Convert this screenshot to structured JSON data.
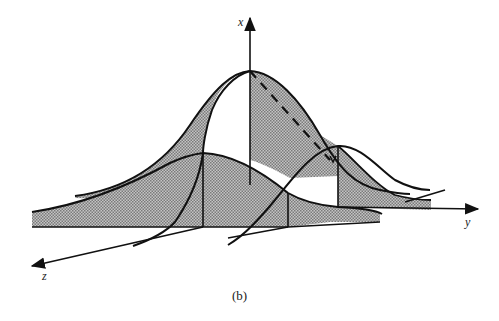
{
  "figure": {
    "caption": "(b)",
    "axes": {
      "x_label": "x",
      "y_label": "y",
      "z_label": "z"
    },
    "colors": {
      "line": "#111111",
      "fill": "#a8a8a8",
      "background": "#ffffff"
    }
  }
}
